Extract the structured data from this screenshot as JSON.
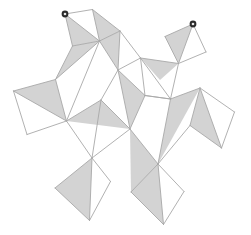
{
  "figure": {
    "background_color": "#ffffff",
    "width": 251,
    "height": 235,
    "stroke_color": "#a8a8a8",
    "stroke_width": 0.9,
    "shaded_fill": "#d3d3d3",
    "unshaded_fill": "#ffffff",
    "marker_outer_color": "#2b2b2b",
    "marker_inner_color": "#e8e8e8",
    "marker_radius": 3.4,
    "marker_inner_radius": 1.3,
    "shape_kind": "polyhedron-net",
    "panel_count": 16,
    "marker_count": 2
  },
  "markers": [
    {
      "name": "start-vertex-marker",
      "x": 65.0,
      "y": 14.0,
      "label": ""
    },
    {
      "name": "end-vertex-marker",
      "x": 193.0,
      "y": 24.0,
      "label": ""
    }
  ],
  "panels": [
    {
      "id": "panel-top-left",
      "quad": [
        [
          65,
          14
        ],
        [
          92.5,
          9.5
        ],
        [
          99.5,
          41.0
        ],
        [
          72.5,
          46.0
        ]
      ],
      "diagonal": [
        [
          65,
          14
        ],
        [
          99.5,
          41.0
        ]
      ],
      "shaded_half": "lower-left"
    },
    {
      "id": "panel-top-left-right",
      "quad": [
        [
          92.5,
          9.5
        ],
        [
          120.0,
          31.0
        ],
        [
          99.5,
          41.0
        ],
        [
          99.5,
          41.0
        ]
      ],
      "diagonal": [
        [
          92.5,
          9.5
        ],
        [
          99.5,
          41.0
        ]
      ],
      "shaded_half": "none"
    },
    {
      "id": "panel-upper-mid",
      "quad": [
        [
          99.5,
          41.0
        ],
        [
          120.0,
          31.0
        ],
        [
          140.5,
          58.0
        ],
        [
          118.0,
          70.0
        ]
      ],
      "diagonal": [
        [
          120.0,
          31.0
        ],
        [
          118.0,
          70.0
        ]
      ],
      "shaded_half": "left"
    },
    {
      "id": "panel-top-right",
      "quad": [
        [
          193.0,
          24.0
        ],
        [
          165.0,
          36.5
        ],
        [
          178.5,
          63.5
        ],
        [
          206.0,
          52.0
        ]
      ],
      "diagonal": [
        [
          193.0,
          24.0
        ],
        [
          178.5,
          63.5
        ]
      ],
      "shaded_half": "left"
    },
    {
      "id": "panel-left-outer",
      "quad": [
        [
          13.5,
          91.0
        ],
        [
          55.5,
          79.5
        ],
        [
          66.5,
          121.0
        ],
        [
          27.0,
          134.5
        ]
      ],
      "diagonal": [
        [
          13.5,
          91.0
        ],
        [
          66.5,
          121.0
        ]
      ],
      "shaded_half": "upper-right"
    },
    {
      "id": "panel-left-upper",
      "quad": [
        [
          55.5,
          79.5
        ],
        [
          72.5,
          46.0
        ],
        [
          99.5,
          41.0
        ],
        [
          66.5,
          121.0
        ]
      ],
      "diagonal": [
        [
          55.5,
          79.5
        ],
        [
          99.5,
          41.0
        ]
      ],
      "shaded_half": "upper-left"
    },
    {
      "id": "panel-center-left",
      "quad": [
        [
          66.5,
          121.0
        ],
        [
          99.5,
          41.0
        ],
        [
          118.0,
          70.0
        ],
        [
          101.0,
          100.0
        ]
      ],
      "diagonal": [
        [
          99.5,
          41.0
        ],
        [
          101.0,
          100.0
        ]
      ],
      "shaded_half": "none"
    },
    {
      "id": "panel-center",
      "quad": [
        [
          101.0,
          100.0
        ],
        [
          118.0,
          70.0
        ],
        [
          145.0,
          95.5
        ],
        [
          130.0,
          129.0
        ]
      ],
      "diagonal": [
        [
          118.0,
          70.0
        ],
        [
          130.0,
          129.0
        ]
      ],
      "shaded_half": "right"
    },
    {
      "id": "panel-center-lower",
      "quad": [
        [
          101.0,
          100.0
        ],
        [
          130.0,
          129.0
        ],
        [
          92.0,
          158.0
        ],
        [
          66.5,
          121.0
        ]
      ],
      "diagonal": [
        [
          101.0,
          100.0
        ],
        [
          92.0,
          158.0
        ]
      ],
      "shaded_half": "right"
    },
    {
      "id": "panel-right-upper",
      "quad": [
        [
          140.5,
          58.0
        ],
        [
          178.5,
          63.5
        ],
        [
          170.5,
          99.0
        ],
        [
          145.0,
          95.5
        ]
      ],
      "diagonal": [
        [
          140.5,
          58.0
        ],
        [
          170.5,
          99.0
        ]
      ],
      "shaded_half": "none"
    },
    {
      "id": "panel-right-mid",
      "quad": [
        [
          145.0,
          95.5
        ],
        [
          170.5,
          99.0
        ],
        [
          200.0,
          88.0
        ],
        [
          158.0,
          164.0
        ]
      ],
      "diagonal": [
        [
          170.5,
          99.0
        ],
        [
          158.0,
          164.0
        ]
      ],
      "shaded_half": "left"
    },
    {
      "id": "panel-right-outer",
      "quad": [
        [
          200.0,
          88.0
        ],
        [
          234.5,
          112.0
        ],
        [
          221.5,
          148.0
        ],
        [
          190.0,
          125.5
        ]
      ],
      "diagonal": [
        [
          200.0,
          88.0
        ],
        [
          221.5,
          148.0
        ]
      ],
      "shaded_half": "left"
    },
    {
      "id": "panel-bottom-left",
      "quad": [
        [
          92.0,
          158.0
        ],
        [
          110.5,
          181.5
        ],
        [
          89.5,
          220.5
        ],
        [
          55.0,
          188.0
        ]
      ],
      "diagonal": [
        [
          92.0,
          158.0
        ],
        [
          89.5,
          220.5
        ]
      ],
      "shaded_half": "left"
    },
    {
      "id": "panel-bottom-right",
      "quad": [
        [
          158.0,
          164.0
        ],
        [
          184.0,
          191.5
        ],
        [
          163.5,
          224.5
        ],
        [
          131.0,
          192.0
        ]
      ],
      "diagonal": [
        [
          158.0,
          164.0
        ],
        [
          163.5,
          224.5
        ]
      ],
      "shaded_half": "left"
    }
  ],
  "shaded_triangles": [
    {
      "id": "tri-top-left-a",
      "points": [
        [
          65,
          14
        ],
        [
          72.5,
          46.0
        ],
        [
          99.5,
          41.0
        ]
      ]
    },
    {
      "id": "tri-top-left-b",
      "points": [
        [
          92.5,
          9.5
        ],
        [
          120.0,
          31.0
        ],
        [
          99.5,
          41.0
        ]
      ]
    },
    {
      "id": "tri-upper-mid",
      "points": [
        [
          99.5,
          41.0
        ],
        [
          120.0,
          31.0
        ],
        [
          118.0,
          70.0
        ]
      ]
    },
    {
      "id": "tri-top-right-a",
      "points": [
        [
          193.0,
          24.0
        ],
        [
          165.0,
          36.5
        ],
        [
          178.5,
          63.5
        ]
      ]
    },
    {
      "id": "tri-left-outer",
      "points": [
        [
          13.5,
          91.0
        ],
        [
          55.5,
          79.5
        ],
        [
          66.5,
          121.0
        ]
      ]
    },
    {
      "id": "tri-left-upper",
      "points": [
        [
          55.5,
          79.5
        ],
        [
          72.5,
          46.0
        ],
        [
          99.5,
          41.0
        ]
      ]
    },
    {
      "id": "tri-center-a",
      "points": [
        [
          118.0,
          70.0
        ],
        [
          145.0,
          95.5
        ],
        [
          130.0,
          129.0
        ]
      ]
    },
    {
      "id": "tri-center-b",
      "points": [
        [
          101.0,
          100.0
        ],
        [
          130.0,
          129.0
        ],
        [
          66.5,
          121.0
        ]
      ]
    },
    {
      "id": "tri-right-mid",
      "points": [
        [
          170.5,
          99.0
        ],
        [
          200.0,
          88.0
        ],
        [
          158.0,
          164.0
        ]
      ]
    },
    {
      "id": "tri-right-outer",
      "points": [
        [
          200.0,
          88.0
        ],
        [
          190.0,
          125.5
        ],
        [
          221.5,
          148.0
        ]
      ]
    },
    {
      "id": "tri-bottom-left",
      "points": [
        [
          92.0,
          158.0
        ],
        [
          55.0,
          188.0
        ],
        [
          89.5,
          220.5
        ]
      ]
    },
    {
      "id": "tri-bottom-right",
      "points": [
        [
          158.0,
          164.0
        ],
        [
          131.0,
          192.0
        ],
        [
          163.5,
          224.5
        ]
      ]
    },
    {
      "id": "tri-right-upper-small",
      "points": [
        [
          140.5,
          58.0
        ],
        [
          178.5,
          63.5
        ],
        [
          160.0,
          80.0
        ]
      ]
    },
    {
      "id": "tri-mid-lower",
      "points": [
        [
          130.0,
          129.0
        ],
        [
          158.0,
          164.0
        ],
        [
          131.0,
          192.0
        ]
      ]
    }
  ],
  "edges": [
    [
      [
        65,
        14
      ],
      [
        92.5,
        9.5
      ]
    ],
    [
      [
        92.5,
        9.5
      ],
      [
        120.0,
        31.0
      ]
    ],
    [
      [
        65,
        14
      ],
      [
        72.5,
        46.0
      ]
    ],
    [
      [
        72.5,
        46.0
      ],
      [
        99.5,
        41.0
      ]
    ],
    [
      [
        99.5,
        41.0
      ],
      [
        120.0,
        31.0
      ]
    ],
    [
      [
        65,
        14
      ],
      [
        99.5,
        41.0
      ]
    ],
    [
      [
        92.5,
        9.5
      ],
      [
        99.5,
        41.0
      ]
    ],
    [
      [
        120.0,
        31.0
      ],
      [
        140.5,
        58.0
      ]
    ],
    [
      [
        140.5,
        58.0
      ],
      [
        118.0,
        70.0
      ]
    ],
    [
      [
        118.0,
        70.0
      ],
      [
        99.5,
        41.0
      ]
    ],
    [
      [
        120.0,
        31.0
      ],
      [
        118.0,
        70.0
      ]
    ],
    [
      [
        193.0,
        24.0
      ],
      [
        165.0,
        36.5
      ]
    ],
    [
      [
        165.0,
        36.5
      ],
      [
        178.5,
        63.5
      ]
    ],
    [
      [
        178.5,
        63.5
      ],
      [
        206.0,
        52.0
      ]
    ],
    [
      [
        206.0,
        52.0
      ],
      [
        193.0,
        24.0
      ]
    ],
    [
      [
        193.0,
        24.0
      ],
      [
        178.5,
        63.5
      ]
    ],
    [
      [
        140.5,
        58.0
      ],
      [
        178.5,
        63.5
      ]
    ],
    [
      [
        178.5,
        63.5
      ],
      [
        170.5,
        99.0
      ]
    ],
    [
      [
        170.5,
        99.0
      ],
      [
        145.0,
        95.5
      ]
    ],
    [
      [
        145.0,
        95.5
      ],
      [
        140.5,
        58.0
      ]
    ],
    [
      [
        140.5,
        58.0
      ],
      [
        170.5,
        99.0
      ]
    ],
    [
      [
        13.5,
        91.0
      ],
      [
        55.5,
        79.5
      ]
    ],
    [
      [
        55.5,
        79.5
      ],
      [
        66.5,
        121.0
      ]
    ],
    [
      [
        66.5,
        121.0
      ],
      [
        27.0,
        134.5
      ]
    ],
    [
      [
        27.0,
        134.5
      ],
      [
        13.5,
        91.0
      ]
    ],
    [
      [
        13.5,
        91.0
      ],
      [
        66.5,
        121.0
      ]
    ],
    [
      [
        55.5,
        79.5
      ],
      [
        72.5,
        46.0
      ]
    ],
    [
      [
        99.5,
        41.0
      ],
      [
        66.5,
        121.0
      ]
    ],
    [
      [
        55.5,
        79.5
      ],
      [
        99.5,
        41.0
      ]
    ],
    [
      [
        66.5,
        121.0
      ],
      [
        101.0,
        100.0
      ]
    ],
    [
      [
        101.0,
        100.0
      ],
      [
        118.0,
        70.0
      ]
    ],
    [
      [
        118.0,
        70.0
      ],
      [
        145.0,
        95.5
      ]
    ],
    [
      [
        145.0,
        95.5
      ],
      [
        130.0,
        129.0
      ]
    ],
    [
      [
        130.0,
        129.0
      ],
      [
        101.0,
        100.0
      ]
    ],
    [
      [
        118.0,
        70.0
      ],
      [
        130.0,
        129.0
      ]
    ],
    [
      [
        130.0,
        129.0
      ],
      [
        92.0,
        158.0
      ]
    ],
    [
      [
        92.0,
        158.0
      ],
      [
        66.5,
        121.0
      ]
    ],
    [
      [
        101.0,
        100.0
      ],
      [
        92.0,
        158.0
      ]
    ],
    [
      [
        170.5,
        99.0
      ],
      [
        200.0,
        88.0
      ]
    ],
    [
      [
        200.0,
        88.0
      ],
      [
        234.5,
        112.0
      ]
    ],
    [
      [
        234.5,
        112.0
      ],
      [
        221.5,
        148.0
      ]
    ],
    [
      [
        221.5,
        148.0
      ],
      [
        190.0,
        125.5
      ]
    ],
    [
      [
        190.0,
        125.5
      ],
      [
        200.0,
        88.0
      ]
    ],
    [
      [
        200.0,
        88.0
      ],
      [
        221.5,
        148.0
      ]
    ],
    [
      [
        190.0,
        125.5
      ],
      [
        158.0,
        164.0
      ]
    ],
    [
      [
        158.0,
        164.0
      ],
      [
        130.0,
        129.0
      ]
    ],
    [
      [
        170.5,
        99.0
      ],
      [
        158.0,
        164.0
      ]
    ],
    [
      [
        145.0,
        95.5
      ],
      [
        170.5,
        99.0
      ]
    ],
    [
      [
        92.0,
        158.0
      ],
      [
        110.5,
        181.5
      ]
    ],
    [
      [
        110.5,
        181.5
      ],
      [
        89.5,
        220.5
      ]
    ],
    [
      [
        89.5,
        220.5
      ],
      [
        55.0,
        188.0
      ]
    ],
    [
      [
        55.0,
        188.0
      ],
      [
        92.0,
        158.0
      ]
    ],
    [
      [
        92.0,
        158.0
      ],
      [
        89.5,
        220.5
      ]
    ],
    [
      [
        158.0,
        164.0
      ],
      [
        184.0,
        191.5
      ]
    ],
    [
      [
        184.0,
        191.5
      ],
      [
        163.5,
        224.5
      ]
    ],
    [
      [
        163.5,
        224.5
      ],
      [
        131.0,
        192.0
      ]
    ],
    [
      [
        131.0,
        192.0
      ],
      [
        158.0,
        164.0
      ]
    ],
    [
      [
        158.0,
        164.0
      ],
      [
        163.5,
        224.5
      ]
    ]
  ]
}
